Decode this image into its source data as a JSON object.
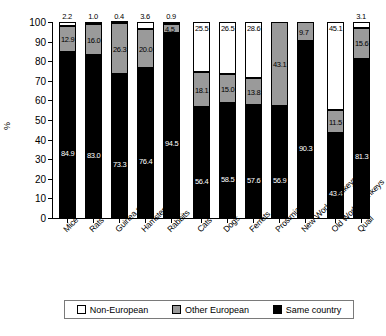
{
  "chart_data": {
    "type": "bar",
    "subtype": "stacked-bar-100-percent",
    "title": "",
    "xlabel": "",
    "ylabel": "%",
    "ylim": [
      0,
      100
    ],
    "yticks": [
      0,
      10,
      20,
      30,
      40,
      50,
      60,
      70,
      80,
      90,
      100
    ],
    "ytick_labels": [
      "0",
      "10",
      "20",
      "30",
      "40",
      "50",
      "60",
      "70",
      "80",
      "90",
      "100"
    ],
    "grid": false,
    "legend_position": "bottom",
    "categories": [
      "Mice",
      "Rats",
      "Guinea pigs",
      "Hamsters",
      "Rabbits",
      "Cats",
      "Dogs",
      "Ferrets",
      "Prosimians",
      "New World monkeys",
      "Old World monkeys",
      "Quail"
    ],
    "series": [
      {
        "name": "Same country",
        "color": "#000000",
        "values": [
          84.9,
          83.0,
          73.3,
          76.4,
          94.5,
          56.4,
          58.5,
          57.6,
          56.9,
          90.3,
          43.4,
          81.3
        ]
      },
      {
        "name": "Other European",
        "color": "#9a9a9a",
        "values": [
          12.9,
          16.0,
          26.3,
          20.0,
          4.5,
          18.1,
          15.0,
          13.8,
          43.1,
          9.7,
          11.5,
          15.6
        ]
      },
      {
        "name": "Non-European",
        "color": "#ffffff",
        "values": [
          2.2,
          1.0,
          0.4,
          3.6,
          0.9,
          25.5,
          26.5,
          28.6,
          0.0,
          0.0,
          45.1,
          3.1
        ]
      }
    ],
    "bar_labels": [
      {
        "category": "Mice",
        "same_country": "84.9",
        "other_european": "12.9",
        "non_european": "2.2",
        "non_european_outside": true
      },
      {
        "category": "Rats",
        "same_country": "83.0",
        "other_european": "16.0",
        "non_european": "1.0",
        "non_european_outside": true
      },
      {
        "category": "Guinea pigs",
        "same_country": "73.3",
        "other_european": "26.3",
        "non_european": "0.4",
        "non_european_outside": true
      },
      {
        "category": "Hamsters",
        "same_country": "76.4",
        "other_european": "20.0",
        "non_european": "3.6",
        "non_european_outside": true
      },
      {
        "category": "Rabbits",
        "same_country": "94.5",
        "other_european": "4.5",
        "non_european": "0.9",
        "non_european_outside": true
      },
      {
        "category": "Cats",
        "same_country": "56.4",
        "other_european": "18.1",
        "non_european": "25.5",
        "non_european_outside": false
      },
      {
        "category": "Dogs",
        "same_country": "58.5",
        "other_european": "15.0",
        "non_european": "26.5",
        "non_european_outside": false
      },
      {
        "category": "Ferrets",
        "same_country": "57.6",
        "other_european": "13.8",
        "non_european": "28.6",
        "non_european_outside": false
      },
      {
        "category": "Prosimians",
        "same_country": "56.9",
        "other_european": "43.1",
        "non_european": "",
        "non_european_outside": false
      },
      {
        "category": "New World monkeys",
        "same_country": "90.3",
        "other_european": "9.7",
        "non_european": "",
        "non_european_outside": false
      },
      {
        "category": "Old World monkeys",
        "same_country": "43.4",
        "other_european": "11.5",
        "non_european": "45.1",
        "non_european_outside": false
      },
      {
        "category": "Quail",
        "same_country": "81.3",
        "other_european": "15.6",
        "non_european": "3.1",
        "non_european_outside": true
      }
    ]
  },
  "legend": {
    "items": [
      {
        "label": "Non-European",
        "swatch": "non-european"
      },
      {
        "label": "Other European",
        "swatch": "other-european"
      },
      {
        "label": "Same country",
        "swatch": "same-country"
      }
    ]
  },
  "axis": {
    "y_title": "%"
  }
}
